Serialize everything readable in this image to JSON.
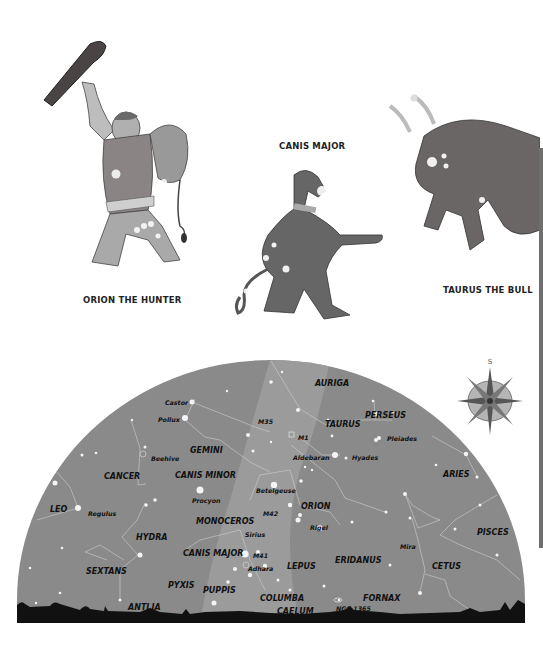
{
  "illustrations": [
    {
      "id": "orion",
      "caption": "ORION THE HUNTER"
    },
    {
      "id": "canis-major",
      "caption": "CANIS MAJOR"
    },
    {
      "id": "taurus",
      "caption": "TAURUS THE BULL"
    }
  ],
  "compass": {
    "direction_label": "S"
  },
  "skymap": {
    "colors": {
      "sky": "#8a8a8a",
      "milky_way": "#9c9c9c",
      "ground": "#111111",
      "stars": "#f2f2f2",
      "lines": "#cfcfcf"
    },
    "constellations": [
      {
        "name": "AURIGA"
      },
      {
        "name": "PERSEUS"
      },
      {
        "name": "TAURUS"
      },
      {
        "name": "GEMINI"
      },
      {
        "name": "CANCER"
      },
      {
        "name": "CANIS MINOR"
      },
      {
        "name": "ARIES"
      },
      {
        "name": "ORION"
      },
      {
        "name": "LEO"
      },
      {
        "name": "MONOCEROS"
      },
      {
        "name": "HYDRA"
      },
      {
        "name": "PISCES"
      },
      {
        "name": "CANIS MAJOR"
      },
      {
        "name": "ERIDANUS"
      },
      {
        "name": "CETUS"
      },
      {
        "name": "SEXTANS"
      },
      {
        "name": "LEPUS"
      },
      {
        "name": "PYXIS"
      },
      {
        "name": "PUPPIS"
      },
      {
        "name": "COLUMBA"
      },
      {
        "name": "FORNAX"
      },
      {
        "name": "ANTLIA"
      },
      {
        "name": "CAELUM"
      }
    ],
    "objects": [
      {
        "name": "Castor"
      },
      {
        "name": "Pollux"
      },
      {
        "name": "M35"
      },
      {
        "name": "M1"
      },
      {
        "name": "Pleiades"
      },
      {
        "name": "Beehive"
      },
      {
        "name": "Aldebaran"
      },
      {
        "name": "Hyades"
      },
      {
        "name": "Betelgeuse"
      },
      {
        "name": "Procyon"
      },
      {
        "name": "Regulus"
      },
      {
        "name": "M42"
      },
      {
        "name": "Rigel"
      },
      {
        "name": "Sirius"
      },
      {
        "name": "Mira"
      },
      {
        "name": "M41"
      },
      {
        "name": "Adhara"
      },
      {
        "name": "NGC 1365"
      }
    ]
  }
}
